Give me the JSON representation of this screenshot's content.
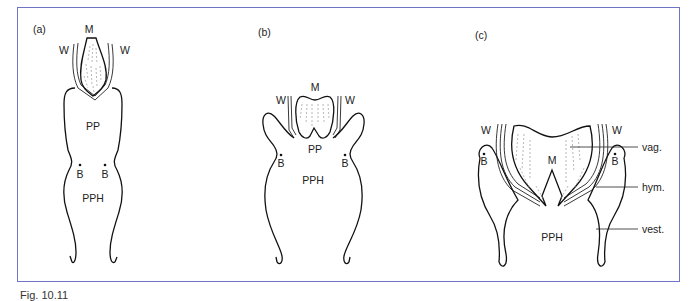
{
  "figure": {
    "panels": [
      {
        "id": "a",
        "panel_label": "(a)",
        "labels": {
          "M": "M",
          "W_left": "W",
          "W_right": "W",
          "PP": "PP",
          "B_left": "B",
          "B_right": "B",
          "PPH": "PPH"
        }
      },
      {
        "id": "b",
        "panel_label": "(b)",
        "labels": {
          "M": "M",
          "W_left": "W",
          "W_right": "W",
          "PP": "PP",
          "B_left": "B",
          "B_right": "B",
          "PPH": "PPH"
        }
      },
      {
        "id": "c",
        "panel_label": "(c)",
        "labels": {
          "M": "M",
          "W_left": "W",
          "W_right": "W",
          "B_left": "B",
          "B_right": "B",
          "PPH": "PPH"
        },
        "callouts": [
          "vag.",
          "hym.",
          "vest."
        ]
      }
    ],
    "frame_color": "#6f74c4",
    "caption_partial": "Fig. 10.11"
  }
}
